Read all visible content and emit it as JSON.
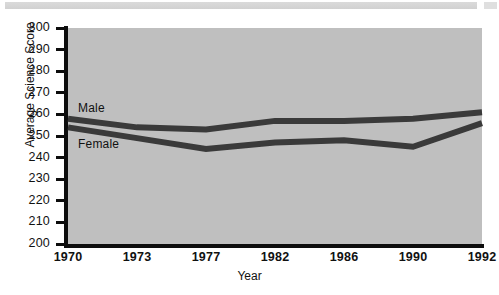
{
  "page": {
    "background": "#ffffff",
    "artifact_band": "scan-edge-band"
  },
  "chart_data": {
    "type": "line",
    "title": "",
    "xlabel": "Year",
    "ylabel": "Average Science Score",
    "categories": [
      "1970",
      "1973",
      "1977",
      "1982",
      "1986",
      "1990",
      "1992"
    ],
    "x": [
      1970,
      1973,
      1977,
      1982,
      1986,
      1990,
      1992
    ],
    "series": [
      {
        "name": "Male",
        "values": [
          258,
          254,
          253,
          257,
          257,
          258,
          261
        ],
        "color": "#3a3a3a"
      },
      {
        "name": "Female",
        "values": [
          254,
          249,
          244,
          247,
          248,
          245,
          256
        ],
        "color": "#3a3a3a"
      }
    ],
    "ylim": [
      200,
      300
    ],
    "ytick_labels": [
      "300",
      "290",
      "280",
      "270",
      "260",
      "250",
      "240",
      "230",
      "220",
      "210",
      "200"
    ],
    "ytick_values": [
      300,
      290,
      280,
      270,
      260,
      250,
      240,
      230,
      220,
      210,
      200
    ],
    "grid": false,
    "legend": "inline-series-labels",
    "plot_background": "#bfbfbf",
    "axis_color": "#0d0d0d",
    "line_width_px": 6,
    "annotations": [
      {
        "text": "Male",
        "near_series": "Male"
      },
      {
        "text": "Female",
        "near_series": "Female"
      }
    ]
  }
}
